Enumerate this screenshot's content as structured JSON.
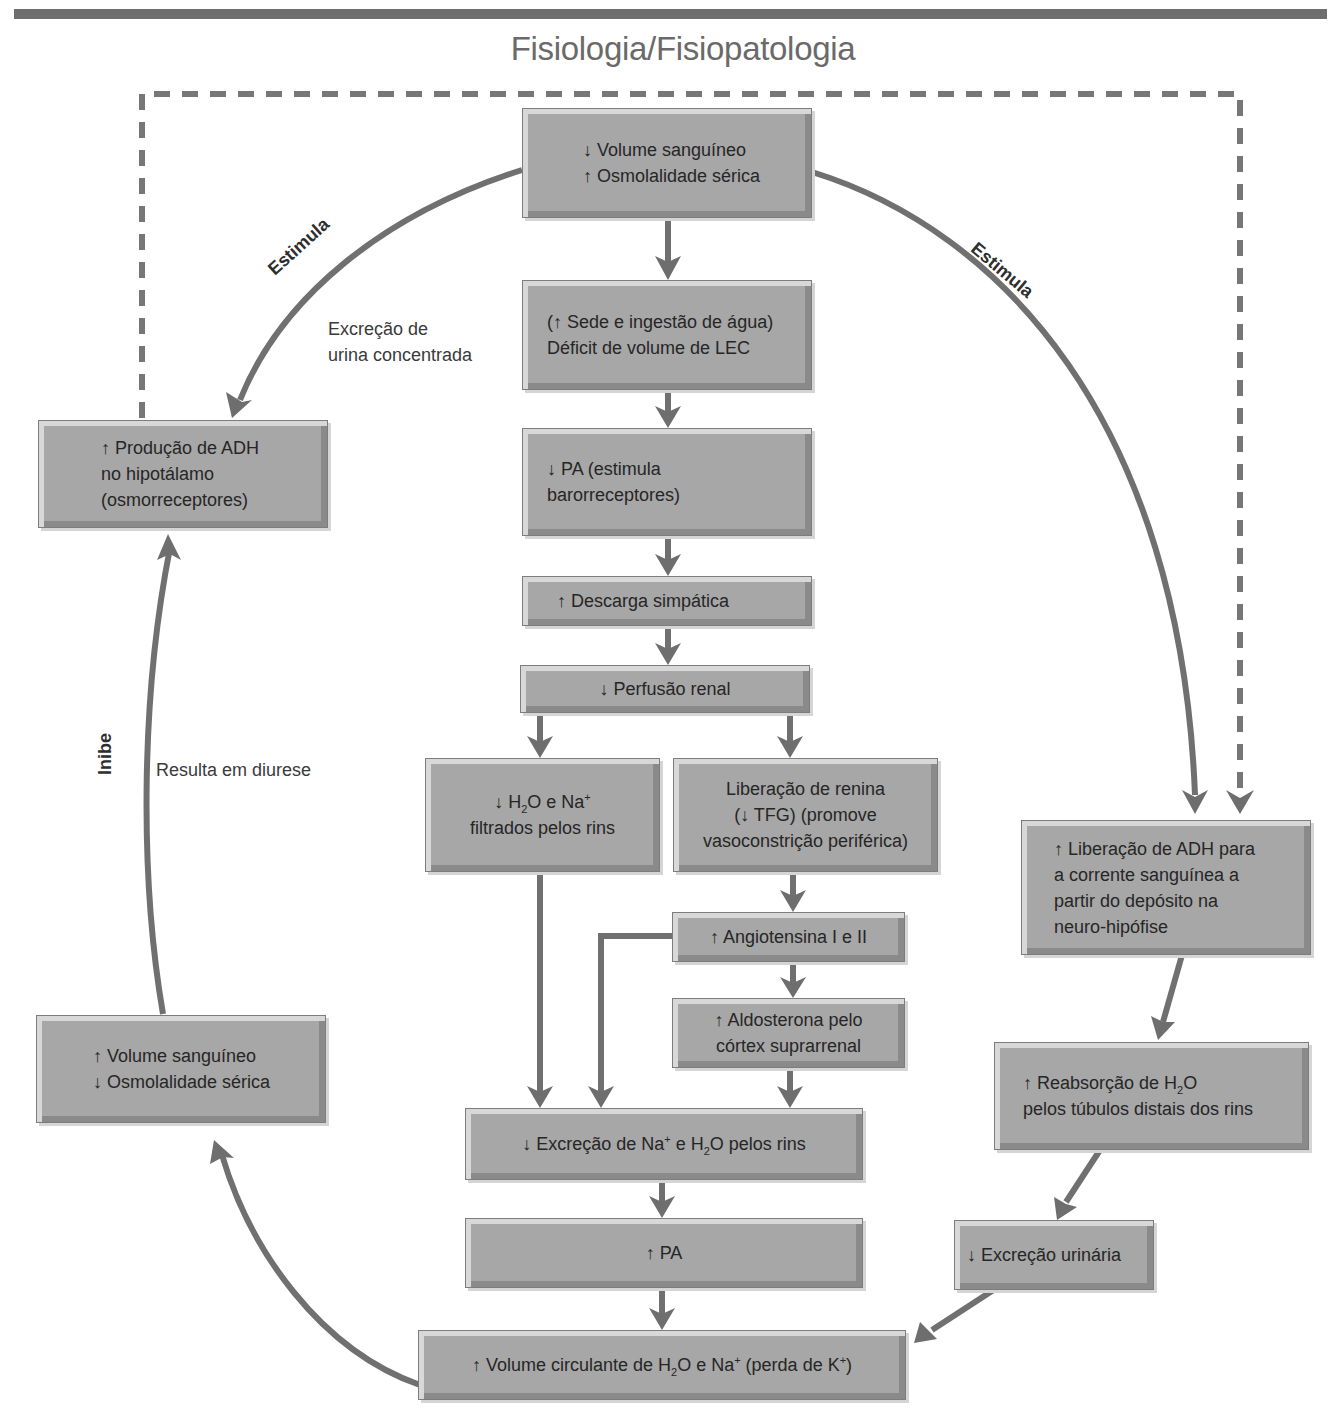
{
  "header": {
    "title": "Fisiologia/Fisiopatologia"
  },
  "colors": {
    "box_fill": "#a7a7a7",
    "arrow": "#6e6e6e",
    "dashed_line": "#777777",
    "title": "#6a6a6a"
  },
  "boxes": {
    "start": {
      "line1": "↓ Volume sanguíneo",
      "line2": "↑ Osmolalidade sérica"
    },
    "thirst": {
      "line1": "(↑ Sede e ingestão de água)",
      "line2": "Déficit de volume de LEC"
    },
    "bp_low": {
      "line1": "↓ PA (estimula",
      "line2": "barorreceptores)"
    },
    "sympathetic": {
      "line1": "↑ Descarga simpática"
    },
    "renal_perfusion": {
      "line1": "↓ Perfusão renal"
    },
    "filtered": {
      "line1_pre": "↓ H",
      "line1_sub": "2",
      "line1_mid": "O e Na",
      "line1_sup": "+",
      "line2": "filtrados pelos rins"
    },
    "renin": {
      "line1": "Liberação de renina",
      "line2": "(↓ TFG) (promove",
      "line3": "vasoconstrição periférica)"
    },
    "angiotensin": {
      "line1": "↑ Angiotensina I e II"
    },
    "aldosterone": {
      "line1": "↑ Aldosterona pelo",
      "line2": "córtex suprarrenal"
    },
    "excretion_na": {
      "pre": "↓ Excreção de Na",
      "sup": "+",
      "mid": " e H",
      "sub": "2",
      "post": "O pelos rins"
    },
    "bp_high": {
      "line1": "↑ PA"
    },
    "circulating": {
      "pre": "↑ Volume circulante de H",
      "sub": "2",
      "mid": "O e Na",
      "sup1": "+",
      "post": " (perda de K",
      "sup2": "+",
      "end": ")"
    },
    "adh_production": {
      "line1": "↑ Produção de ADH",
      "line2": "no hipotálamo",
      "line3": "(osmorreceptores)"
    },
    "blood_volume_up": {
      "line1": "↑ Volume sanguíneo",
      "line2": "↓ Osmolalidade sérica"
    },
    "adh_release": {
      "line1": "↑ Liberação de ADH para",
      "line2": "a corrente sanguínea a",
      "line3": "partir do depósito na",
      "line4": "neuro-hipófise"
    },
    "reabsorption": {
      "pre": "↑ Reabsorção de H",
      "sub": "2",
      "post": "O",
      "line2": "pelos túbulos distais dos rins"
    },
    "urinary": {
      "line1": "↓ Excreção urinária"
    }
  },
  "labels": {
    "stimulates_left": "Estimula",
    "stimulates_right": "Estimula",
    "concentrated_urine_1": "Excreção de",
    "concentrated_urine_2": "urina concentrada",
    "inhibits": "Inibe",
    "diuresis": "Resulta em diurese"
  }
}
